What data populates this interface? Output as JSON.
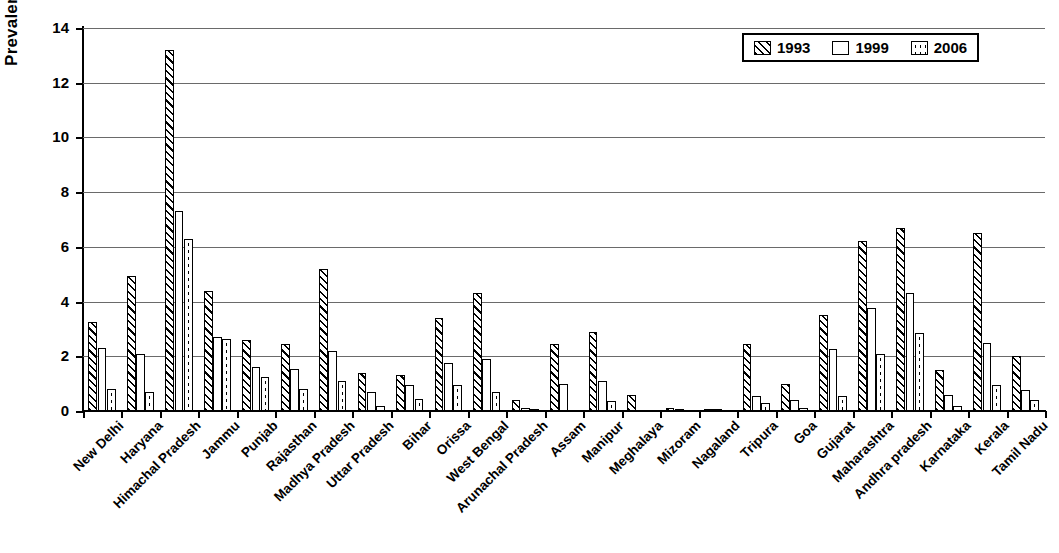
{
  "chart_data": {
    "type": "bar",
    "title": "",
    "xlabel": "",
    "ylabel": "Prevalence",
    "ylim": [
      0,
      14
    ],
    "ytick_step": 2,
    "yticks": [
      "0",
      "2",
      "4",
      "6",
      "8",
      "10",
      "12",
      "14"
    ],
    "grid": true,
    "legend_position": "top-right",
    "categories": [
      "New Delhi",
      "Haryana",
      "Himachal Pradesh",
      "Jammu",
      "Punjab",
      "Rajasthan",
      "Madhya Pradesh",
      "Uttar Pradesh",
      "Bihar",
      "Orissa",
      "West Bengal",
      "Arunachal Pradesh",
      "Assam",
      "Manipur",
      "Meghalaya",
      "Mizoram",
      "Nagaland",
      "Tripura",
      "Goa",
      "Gujarat",
      "Maharashtra",
      "Andhra pradesh",
      "Karnataka",
      "Kerala",
      "Tamil Nadu"
    ],
    "series": [
      {
        "name": "1993",
        "pattern": "diagonal-hatch",
        "values": [
          3.25,
          4.95,
          13.2,
          4.4,
          2.6,
          2.45,
          5.2,
          1.4,
          1.3,
          3.4,
          4.3,
          0.4,
          2.45,
          2.9,
          0.6,
          0.1,
          0.07,
          2.45,
          1.0,
          3.5,
          6.2,
          6.7,
          1.5,
          6.5,
          2.0
        ]
      },
      {
        "name": "1999",
        "pattern": "checker",
        "values": [
          2.3,
          2.1,
          7.3,
          2.7,
          1.6,
          1.55,
          2.2,
          0.7,
          0.95,
          1.75,
          1.9,
          0.1,
          1.0,
          1.1,
          0.0,
          0.07,
          0.05,
          0.55,
          0.4,
          2.25,
          3.75,
          4.3,
          0.6,
          2.5,
          0.75
        ]
      },
      {
        "name": "2006",
        "pattern": "dots",
        "values": [
          0.8,
          0.7,
          6.3,
          2.65,
          1.25,
          0.8,
          1.1,
          0.2,
          0.45,
          0.95,
          0.7,
          0.05,
          0.0,
          0.35,
          0.0,
          0.0,
          0.0,
          0.3,
          0.1,
          0.55,
          2.1,
          2.85,
          0.2,
          0.95,
          0.4
        ]
      }
    ]
  },
  "legend": {
    "items": [
      {
        "label": "1993"
      },
      {
        "label": "1999"
      },
      {
        "label": "2006"
      }
    ]
  },
  "axis": {
    "y_title": "Prevalence"
  }
}
